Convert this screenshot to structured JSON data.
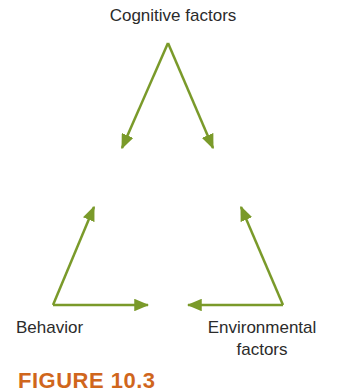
{
  "diagram": {
    "nodes": {
      "top": "Cognitive factors",
      "left": "Behavior",
      "right_line1": "Environmental",
      "right_line2": "factors"
    },
    "arrow_color": "#7a9a2a",
    "edges": [
      {
        "from": "Cognitive factors",
        "to": "Behavior"
      },
      {
        "from": "Cognitive factors",
        "to": "Environmental factors"
      },
      {
        "from": "Behavior",
        "to": "Cognitive factors"
      },
      {
        "from": "Behavior",
        "to": "Environmental factors"
      },
      {
        "from": "Environmental factors",
        "to": "Cognitive factors"
      },
      {
        "from": "Environmental factors",
        "to": "Behavior"
      }
    ]
  },
  "caption": "FIGURE 10.3"
}
